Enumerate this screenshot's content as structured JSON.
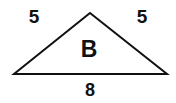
{
  "figure": {
    "type": "triangle",
    "shape_name": "isosceles-triangle",
    "background_color": "#ffffff",
    "stroke_color": "#111111",
    "stroke_width": 2,
    "vertices": {
      "apex": {
        "x": 90,
        "y": 13
      },
      "bottom_left": {
        "x": 14,
        "y": 74
      },
      "bottom_right": {
        "x": 167,
        "y": 74
      }
    },
    "interior_label": "B",
    "labels": {
      "left_side": "5",
      "right_side": "5",
      "base": "8",
      "interior": "B"
    },
    "measurements": {
      "left_side_length": 5,
      "right_side_length": 5,
      "base_length": 8
    }
  }
}
